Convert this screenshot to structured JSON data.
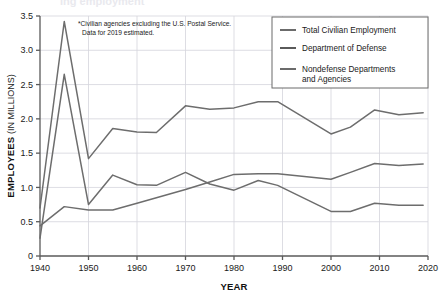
{
  "figure": {
    "title_fragment": "ing employment",
    "annotation_line1": "*Civilian agencies excluding the U.S. Postal Service.",
    "annotation_line2": "Data for 2019 estimated."
  },
  "axes": {
    "xlabel": "YEAR",
    "ylabel_bold": "EMPLOYEES",
    "ylabel_plain": "(IN MILLIONS)",
    "xticks": [
      "1940",
      "1950",
      "1960",
      "1970",
      "1980",
      "1990",
      "2000",
      "2010",
      "2020"
    ],
    "yticks": [
      "0",
      "0.5",
      "1.0",
      "1.5",
      "2.0",
      "2.5",
      "3.0",
      "3.5"
    ]
  },
  "legend": {
    "items": [
      {
        "label": "Total Civilian Employment",
        "color": "#6b6b6b"
      },
      {
        "label": "Department of Defense",
        "color": "#5a5a5a"
      },
      {
        "label": "Nondefense Departments",
        "label2": "and Agencies",
        "color": "#6b6b6b"
      }
    ]
  },
  "colors": {
    "line": "#6d6d6d",
    "grid": "#d4d4dc",
    "axis": "#5a5a5a",
    "legend_border": "#6b6b6b"
  },
  "chart_data": {
    "type": "line",
    "xlabel": "YEAR",
    "ylabel": "EMPLOYEES (IN MILLIONS)",
    "xlim": [
      1940,
      2020
    ],
    "ylim": [
      0,
      3.5
    ],
    "grid": true,
    "legend_position": "top-right",
    "annotations": [
      "*Civilian agencies excluding the U.S. Postal Service.",
      "Data for 2019 estimated."
    ],
    "series": [
      {
        "name": "Total Civilian Employment",
        "x": [
          1940,
          1945,
          1950,
          1955,
          1960,
          1964,
          1970,
          1975,
          1980,
          1985,
          1989,
          2000,
          2004,
          2009,
          2014,
          2019
        ],
        "values": [
          0.7,
          3.42,
          1.42,
          1.86,
          1.81,
          1.8,
          2.19,
          2.14,
          2.16,
          2.25,
          2.25,
          1.78,
          1.88,
          2.13,
          2.06,
          2.09
        ]
      },
      {
        "name": "Department of Defense",
        "x": [
          1940,
          1945,
          1950,
          1955,
          1960,
          1964,
          1970,
          1975,
          1980,
          1985,
          1989,
          2000,
          2004,
          2009,
          2014,
          2019
        ],
        "values": [
          0.26,
          2.65,
          0.75,
          1.18,
          1.04,
          1.03,
          1.22,
          1.05,
          0.96,
          1.1,
          1.03,
          0.65,
          0.65,
          0.77,
          0.74,
          0.74
        ]
      },
      {
        "name": "Nondefense Departments and Agencies",
        "x": [
          1940,
          1945,
          1950,
          1955,
          1960,
          1964,
          1970,
          1975,
          1980,
          1985,
          1989,
          2000,
          2004,
          2009,
          2014,
          2019
        ],
        "values": [
          0.44,
          0.72,
          0.67,
          0.67,
          0.77,
          0.85,
          0.97,
          1.08,
          1.19,
          1.2,
          1.2,
          1.12,
          1.22,
          1.35,
          1.32,
          1.34
        ]
      }
    ]
  }
}
